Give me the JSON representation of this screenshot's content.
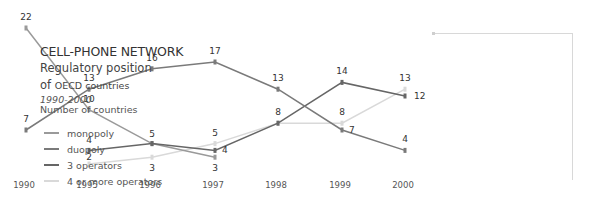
{
  "legend": {
    "title": "CELL-PHONE NETWORK",
    "subtitle1": "Regulatory position",
    "subtitle2_prefix": "of",
    "subtitle2_rest": "OECD countries",
    "period": "1990-2000",
    "unit": "Number of countries",
    "items": [
      {
        "label": "monopoly",
        "color": "#9a9a9a"
      },
      {
        "label": "duopoly",
        "color": "#7a7a7a"
      },
      {
        "label": "3 operators",
        "color": "#666666"
      },
      {
        "label": "4 or more operators",
        "color": "#d9d9d9"
      }
    ]
  },
  "chart_data": {
    "type": "line",
    "xlabel": "",
    "ylabel": "Number of countries",
    "categories": [
      "1990",
      "1995",
      "1996",
      "1997",
      "1998",
      "1999",
      "2000"
    ],
    "series": [
      {
        "name": "monopoly",
        "color": "#9a9a9a",
        "values": [
          22,
          10,
          5,
          3,
          null,
          null,
          null
        ]
      },
      {
        "name": "duopoly",
        "color": "#7a7a7a",
        "values": [
          7,
          13,
          16,
          17,
          13,
          7,
          4
        ]
      },
      {
        "name": "3 operators",
        "color": "#666666",
        "values": [
          null,
          4,
          5,
          4,
          8,
          14,
          12
        ]
      },
      {
        "name": "4 or more operators",
        "color": "#d9d9d9",
        "values": [
          null,
          2,
          3,
          5,
          8,
          8,
          13
        ]
      }
    ],
    "grid": false,
    "legend_position": "right",
    "ylim": [
      0,
      22
    ]
  }
}
